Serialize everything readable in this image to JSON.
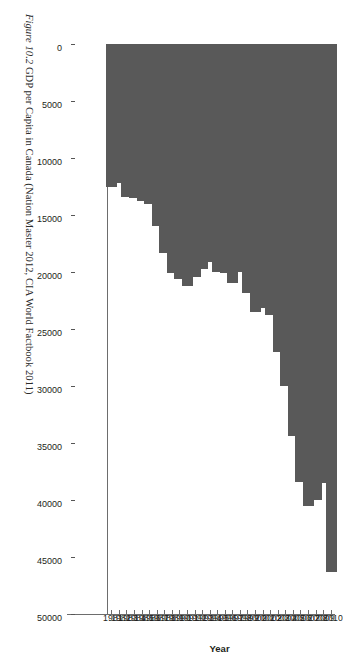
{
  "figure": {
    "caption_label": "Figure 10.2",
    "caption_text": "GDP per Capita in Canada (Nation Master 2012, CIA World Factbook 2011)"
  },
  "chart_data": {
    "type": "bar",
    "orientation": "vertical",
    "title": "",
    "xlabel": "Year",
    "ylabel": "Dollar (in term of US$)",
    "ylim": [
      0,
      50000
    ],
    "ytick_step": 5000,
    "ytick_labels": [
      "0",
      "5000",
      "10000",
      "15000",
      "20000",
      "25000",
      "30000",
      "35000",
      "40000",
      "45000",
      "50000"
    ],
    "grid": false,
    "legend": null,
    "bar_color": "#595959",
    "axis_color": "#6d6d6d",
    "categories": [
      "1981",
      "1982",
      "1983",
      "1984",
      "1985",
      "1986",
      "1987",
      "1988",
      "1989",
      "1990",
      "1991",
      "1992",
      "1993",
      "1994",
      "1995",
      "1996",
      "1997",
      "1998",
      "1999",
      "2000",
      "2001",
      "2002",
      "2003",
      "2004",
      "2005",
      "2006",
      "2007",
      "2008",
      "2009",
      "2010"
    ],
    "values": [
      12500,
      12200,
      13400,
      13500,
      13800,
      14000,
      16000,
      18300,
      20100,
      20600,
      21200,
      20400,
      19700,
      19100,
      20000,
      20100,
      21000,
      20000,
      21800,
      23500,
      23200,
      23800,
      27000,
      30000,
      34400,
      38400,
      40500,
      40000,
      38500,
      46300
    ]
  }
}
